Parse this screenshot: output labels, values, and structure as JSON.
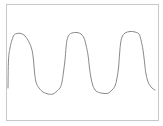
{
  "chart_data": {
    "type": "line",
    "title": "",
    "xlabel": "",
    "ylabel": "",
    "grid": false,
    "legend": null,
    "axes_visible": false,
    "frame": {
      "x": 6,
      "y": 4,
      "width": 152,
      "height": 116,
      "color": "#c8c8c8"
    },
    "series": [
      {
        "name": "waveform",
        "color": "#8a8a8a",
        "points": [
          [
            8,
            88
          ],
          [
            8.5,
            60
          ],
          [
            10,
            48
          ],
          [
            12,
            40
          ],
          [
            14,
            35
          ],
          [
            17,
            33.5
          ],
          [
            21,
            33.5
          ],
          [
            25,
            36
          ],
          [
            29,
            42
          ],
          [
            32,
            50
          ],
          [
            33.5,
            60
          ],
          [
            34.5,
            72
          ],
          [
            36,
            82
          ],
          [
            39,
            88
          ],
          [
            43,
            92
          ],
          [
            48,
            94
          ],
          [
            53,
            94
          ],
          [
            57,
            91
          ],
          [
            60,
            88
          ],
          [
            62,
            82
          ],
          [
            63.5,
            72
          ],
          [
            65,
            60
          ],
          [
            66,
            48
          ],
          [
            67,
            40
          ],
          [
            69,
            35
          ],
          [
            72,
            33
          ],
          [
            77,
            32.5
          ],
          [
            81,
            34
          ],
          [
            84,
            38
          ],
          [
            86,
            45
          ],
          [
            88,
            55
          ],
          [
            89.5,
            68
          ],
          [
            91,
            78
          ],
          [
            93,
            86
          ],
          [
            96,
            91
          ],
          [
            101,
            93
          ],
          [
            107,
            93.5
          ],
          [
            111,
            91
          ],
          [
            115,
            86
          ],
          [
            117,
            78
          ],
          [
            118.5,
            68
          ],
          [
            119.5,
            55
          ],
          [
            120.5,
            44
          ],
          [
            122,
            37
          ],
          [
            125,
            33
          ],
          [
            130,
            31.5
          ],
          [
            135,
            32
          ],
          [
            139,
            34
          ],
          [
            141,
            40
          ],
          [
            143,
            50
          ],
          [
            144.5,
            62
          ],
          [
            146,
            74
          ],
          [
            148.5,
            83
          ],
          [
            152,
            88
          ],
          [
            155,
            90
          ]
        ]
      }
    ]
  }
}
